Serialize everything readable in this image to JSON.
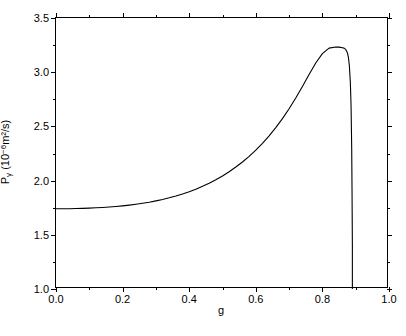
{
  "chart_data": {
    "type": "line",
    "title": "",
    "xlabel": "g",
    "ylabel_text": "P",
    "ylabel_sub": "γ",
    "ylabel_units": " (10",
    "ylabel_exp": "−6",
    "ylabel_units_tail": "m²/s)",
    "ylabel_full": "Pγ (10−6m²/s)",
    "xlim": [
      0.0,
      1.0
    ],
    "ylim": [
      1.0,
      3.5
    ],
    "grid": false,
    "legend": null,
    "line_color": "#000000",
    "line_width": 1.1,
    "background": "#ffffff",
    "xticks": [
      "0.0",
      "0.2",
      "0.4",
      "0.6",
      "0.8",
      "1.0"
    ],
    "xtick_values": [
      0.0,
      0.2,
      0.4,
      0.6,
      0.8,
      1.0
    ],
    "xminor_values": [
      0.1,
      0.3,
      0.5,
      0.7,
      0.9
    ],
    "yticks": [
      "1.0",
      "1.5",
      "2.0",
      "2.5",
      "3.0",
      "3.5"
    ],
    "ytick_values": [
      1.0,
      1.5,
      2.0,
      2.5,
      3.0,
      3.5
    ],
    "yminor_values": [
      1.25,
      1.75,
      2.25,
      2.75,
      3.25
    ],
    "series": [
      {
        "name": "P_gamma",
        "x": [
          0.0,
          0.02,
          0.04,
          0.06,
          0.08,
          0.1,
          0.12,
          0.14,
          0.16,
          0.18,
          0.2,
          0.22,
          0.24,
          0.26,
          0.28,
          0.3,
          0.32,
          0.34,
          0.36,
          0.38,
          0.4,
          0.42,
          0.44,
          0.46,
          0.48,
          0.5,
          0.52,
          0.54,
          0.56,
          0.58,
          0.6,
          0.62,
          0.64,
          0.66,
          0.68,
          0.7,
          0.72,
          0.74,
          0.76,
          0.78,
          0.8,
          0.82,
          0.84,
          0.85,
          0.86,
          0.865,
          0.87,
          0.875,
          0.878,
          0.881,
          0.884,
          0.886,
          0.888,
          0.889,
          0.89,
          0.89
        ],
        "y": [
          1.74,
          1.74,
          1.741,
          1.742,
          1.744,
          1.746,
          1.749,
          1.752,
          1.756,
          1.761,
          1.767,
          1.774,
          1.782,
          1.791,
          1.801,
          1.813,
          1.826,
          1.841,
          1.858,
          1.877,
          1.898,
          1.921,
          1.947,
          1.976,
          2.008,
          2.043,
          2.082,
          2.125,
          2.172,
          2.224,
          2.281,
          2.344,
          2.413,
          2.489,
          2.572,
          2.663,
          2.762,
          2.868,
          2.978,
          3.085,
          3.172,
          3.222,
          3.233,
          3.231,
          3.226,
          3.222,
          3.21,
          3.18,
          3.14,
          3.06,
          2.9,
          2.7,
          2.3,
          1.9,
          1.4,
          1.0
        ]
      }
    ]
  },
  "caption": ""
}
